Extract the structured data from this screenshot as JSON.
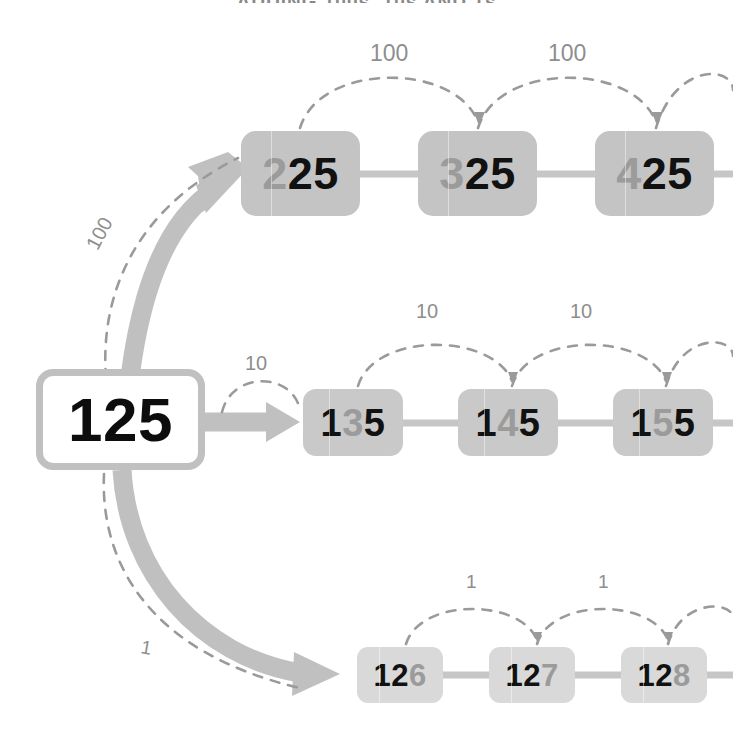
{
  "page": {
    "clipped_header_text": "ADDING 100s, 10s AND 1s"
  },
  "colors": {
    "background": "#ffffff",
    "source_border": "#c0c0c0",
    "hundreds_box": "#c4c4c4",
    "tens_box": "#c9c9c9",
    "ones_box": "#d9d9d9",
    "arrow": "#c0c0c0",
    "dashed_arc": "#9a9a9a",
    "digit_active": "#111111",
    "digit_dim": "#9b9b9b",
    "label_text": "#8e8e8e"
  },
  "source": {
    "name": "start-number",
    "value": "125",
    "digits": [
      {
        "char": "1",
        "state": "on"
      },
      {
        "char": "2",
        "state": "on"
      },
      {
        "char": "5",
        "state": "on"
      }
    ]
  },
  "branch_arrows": [
    {
      "name": "arrow-to-hundreds",
      "step_label": "100",
      "direction": "up-right"
    },
    {
      "name": "arrow-to-tens",
      "step_label": "10",
      "direction": "right"
    },
    {
      "name": "arrow-to-ones",
      "step_label": "1",
      "direction": "down-right"
    }
  ],
  "rows": [
    {
      "name": "hundreds-row",
      "step": "100",
      "step_labels": [
        "100",
        "100",
        "100"
      ],
      "changing_digit_index": 0,
      "nodes": [
        {
          "value": "225",
          "x": 241,
          "digits": [
            {
              "char": "2",
              "state": "dim"
            },
            {
              "char": "2",
              "state": "on"
            },
            {
              "char": "5",
              "state": "on"
            }
          ]
        },
        {
          "value": "325",
          "x": 418,
          "digits": [
            {
              "char": "3",
              "state": "dim"
            },
            {
              "char": "2",
              "state": "on"
            },
            {
              "char": "5",
              "state": "on"
            }
          ]
        },
        {
          "value": "425",
          "x": 595,
          "digits": [
            {
              "char": "4",
              "state": "dim"
            },
            {
              "char": "2",
              "state": "on"
            },
            {
              "char": "5",
              "state": "on"
            }
          ]
        }
      ]
    },
    {
      "name": "tens-row",
      "step": "10",
      "step_labels": [
        "10",
        "10",
        "10"
      ],
      "changing_digit_index": 1,
      "nodes": [
        {
          "value": "135",
          "x": 303,
          "digits": [
            {
              "char": "1",
              "state": "on"
            },
            {
              "char": "3",
              "state": "dim"
            },
            {
              "char": "5",
              "state": "on"
            }
          ]
        },
        {
          "value": "145",
          "x": 458,
          "digits": [
            {
              "char": "1",
              "state": "on"
            },
            {
              "char": "4",
              "state": "dim"
            },
            {
              "char": "5",
              "state": "on"
            }
          ]
        },
        {
          "value": "155",
          "x": 613,
          "digits": [
            {
              "char": "1",
              "state": "on"
            },
            {
              "char": "5",
              "state": "dim"
            },
            {
              "char": "5",
              "state": "on"
            }
          ]
        }
      ]
    },
    {
      "name": "ones-row",
      "step": "1",
      "step_labels": [
        "1",
        "1",
        "1"
      ],
      "changing_digit_index": 2,
      "nodes": [
        {
          "value": "126",
          "x": 357,
          "digits": [
            {
              "char": "1",
              "state": "on"
            },
            {
              "char": "2",
              "state": "on"
            },
            {
              "char": "6",
              "state": "dim"
            }
          ]
        },
        {
          "value": "127",
          "x": 489,
          "digits": [
            {
              "char": "1",
              "state": "on"
            },
            {
              "char": "2",
              "state": "on"
            },
            {
              "char": "7",
              "state": "dim"
            }
          ]
        },
        {
          "value": "128",
          "x": 621,
          "digits": [
            {
              "char": "1",
              "state": "on"
            },
            {
              "char": "2",
              "state": "on"
            },
            {
              "char": "8",
              "state": "dim"
            }
          ]
        }
      ]
    }
  ],
  "arc_labels": {
    "hundreds": [
      "100",
      "100"
    ],
    "tens": [
      "10",
      "10"
    ],
    "ones": [
      "1",
      "1"
    ],
    "branch_hundreds": "100",
    "branch_tens": "10",
    "branch_ones": "1"
  }
}
